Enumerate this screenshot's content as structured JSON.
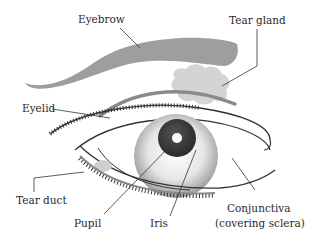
{
  "diagram": {
    "type": "anatomy",
    "labels": {
      "eyebrow": "Eyebrow",
      "tear_gland": "Tear gland",
      "eyelid": "Eyelid",
      "tear_duct": "Tear duct",
      "pupil": "Pupil",
      "iris": "Iris",
      "conjunctiva_line1": "Conjunctiva",
      "conjunctiva_line2": "(covering sclera)"
    },
    "colors": {
      "eyebrow": "#9a9a9a",
      "tear_gland": "#cfcfcf",
      "lid_fold": "#8c8c8c",
      "outline": "#333333",
      "iris_dark": "#3a3a3a",
      "pupil_highlight": "#ffffff"
    }
  }
}
